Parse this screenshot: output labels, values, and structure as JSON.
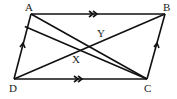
{
  "diagram": {
    "type": "parallelogram-geometry",
    "points": {
      "A": {
        "label": "A",
        "x": 31,
        "y": 14
      },
      "B": {
        "label": "B",
        "x": 165,
        "y": 14
      },
      "C": {
        "label": "C",
        "x": 147,
        "y": 79
      },
      "D": {
        "label": "D",
        "x": 14,
        "y": 79
      },
      "X": {
        "label": "X",
        "x": 76,
        "y": 51
      },
      "Y": {
        "label": "Y",
        "x": 101,
        "y": 41
      }
    },
    "segments": [
      "AB",
      "DC",
      "AD",
      "BC",
      "DB",
      "AC",
      "AC2"
    ],
    "parallel_marks": {
      "AB_DC": ">>",
      "AD_BC": ">"
    }
  }
}
